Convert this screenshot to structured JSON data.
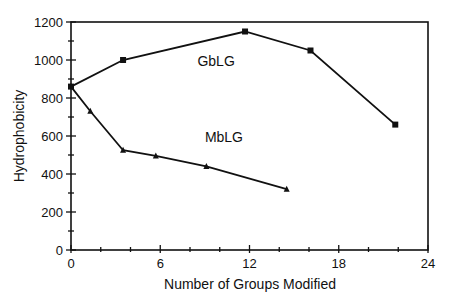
{
  "chart_data": {
    "type": "line",
    "title": "",
    "xlabel": "Number of Groups Modified",
    "ylabel": "Hydrophobicity",
    "xlim": [
      0,
      24
    ],
    "ylim": [
      0,
      1200
    ],
    "xticks": [
      0,
      6,
      12,
      18,
      24
    ],
    "yticks": [
      0,
      200,
      400,
      600,
      800,
      1000,
      1200
    ],
    "grid": false,
    "legend": "inline labels",
    "series": [
      {
        "name": "GbLG",
        "marker": "square",
        "label_pos": [
          8.5,
          970
        ],
        "points": [
          [
            0,
            860
          ],
          [
            3.5,
            1000
          ],
          [
            11.7,
            1150
          ],
          [
            16.1,
            1050
          ],
          [
            21.8,
            660
          ]
        ]
      },
      {
        "name": "MbLG",
        "marker": "triangle",
        "label_pos": [
          9,
          570
        ],
        "points": [
          [
            0,
            860
          ],
          [
            1.3,
            730
          ],
          [
            3.5,
            525
          ],
          [
            5.7,
            495
          ],
          [
            9.1,
            440
          ],
          [
            14.5,
            320
          ]
        ]
      }
    ]
  }
}
